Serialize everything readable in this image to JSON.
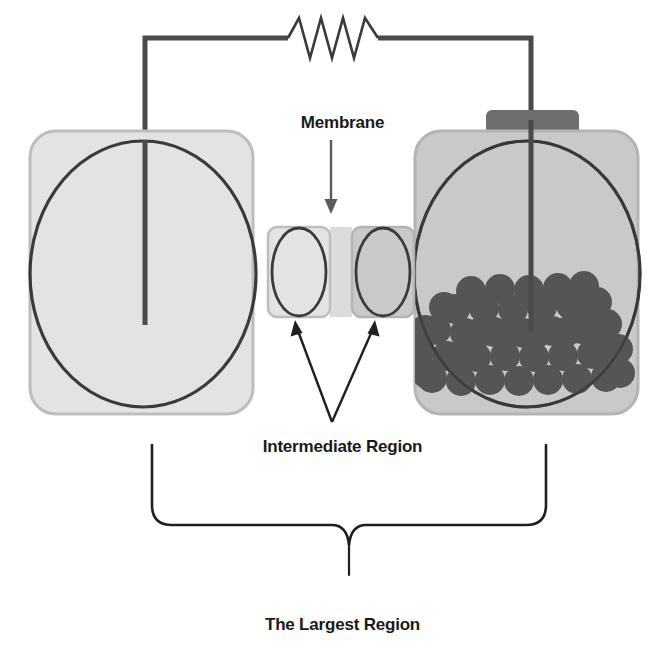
{
  "figure": {
    "kind": "electrochemical-cell-schematic",
    "background_color": "#ffffff"
  },
  "labels": {
    "membrane": "Membrane",
    "intermediate_region": "Intermediate Region",
    "largest_region": "The Largest Region"
  },
  "colors": {
    "chamber_fill_left": "#e3e3e3",
    "chamber_fill_right": "#c9c9c9",
    "chamber_stroke": "#b9b9b9",
    "membrane_fill": "#dcdcdc",
    "outline_dark": "#3a3a3a",
    "electrode": "#4a4a4a",
    "wire": "#4a4a4a",
    "cap_fill": "#6e6e6e",
    "particle_fill": "#555555",
    "text": "#1a1a1a"
  },
  "circuit": {
    "resistor_peaks": 4,
    "wire_top_y": 38,
    "left_electrode_x": 145,
    "right_electrode_x": 531,
    "resistor_start_x": 288,
    "resistor_end_x": 378
  },
  "chambers": {
    "left": {
      "name": "left-reservoir",
      "x": 30,
      "y": 131,
      "width": 223,
      "height": 283,
      "radius": 26,
      "ellipse_cx": 143,
      "ellipse_cy": 274,
      "ellipse_rx": 113,
      "ellipse_ry": 133
    },
    "right": {
      "name": "right-reservoir",
      "x": 415,
      "y": 131,
      "width": 223,
      "height": 283,
      "radius": 26,
      "ellipse_cx": 527,
      "ellipse_cy": 274,
      "ellipse_rx": 113,
      "ellipse_ry": 133,
      "cap": {
        "x": 486,
        "y": 110,
        "width": 93,
        "height": 25,
        "radius": 6
      }
    },
    "intermediate_left": {
      "name": "intermediate-chamber-left",
      "x": 268,
      "y": 227,
      "width": 62,
      "height": 90,
      "radius": 9,
      "ellipse_cx": 299,
      "ellipse_cy": 272,
      "ellipse_rx": 27,
      "ellipse_ry": 44
    },
    "intermediate_right": {
      "name": "intermediate-chamber-right",
      "x": 352,
      "y": 227,
      "width": 62,
      "height": 90,
      "radius": 9,
      "ellipse_cx": 383,
      "ellipse_cy": 272,
      "ellipse_rx": 27,
      "ellipse_ry": 44
    },
    "membrane_strip": {
      "x": 330,
      "y": 227,
      "width": 22,
      "height": 90
    }
  },
  "particles": {
    "count": 46,
    "radius": 15,
    "items": [
      [
        432,
        378
      ],
      [
        461,
        381
      ],
      [
        490,
        380
      ],
      [
        519,
        381
      ],
      [
        548,
        380
      ],
      [
        577,
        379
      ],
      [
        606,
        377
      ],
      [
        419,
        352
      ],
      [
        447,
        356
      ],
      [
        476,
        357
      ],
      [
        505,
        356
      ],
      [
        534,
        357
      ],
      [
        563,
        356
      ],
      [
        592,
        354
      ],
      [
        618,
        349
      ],
      [
        436,
        330
      ],
      [
        465,
        333
      ],
      [
        494,
        332
      ],
      [
        523,
        333
      ],
      [
        552,
        331
      ],
      [
        581,
        329
      ],
      [
        607,
        324
      ],
      [
        455,
        309
      ],
      [
        484,
        308
      ],
      [
        513,
        309
      ],
      [
        542,
        307
      ],
      [
        571,
        305
      ],
      [
        597,
        302
      ],
      [
        471,
        291
      ],
      [
        500,
        289
      ],
      [
        529,
        290
      ],
      [
        558,
        288
      ],
      [
        584,
        286
      ],
      [
        444,
        307
      ],
      [
        425,
        330
      ],
      [
        413,
        352
      ],
      [
        427,
        374
      ],
      [
        456,
        358
      ],
      [
        609,
        352
      ],
      [
        620,
        373
      ],
      [
        599,
        329
      ],
      [
        588,
        307
      ],
      [
        566,
        332
      ],
      [
        537,
        333
      ],
      [
        508,
        333
      ],
      [
        479,
        333
      ]
    ]
  },
  "annotations": {
    "membrane_arrow": {
      "x": 331,
      "y_start": 140,
      "y_end": 212
    },
    "intermediate_arrows": {
      "apex_x": 332,
      "apex_y": 422,
      "left_tip_x": 296,
      "left_tip_y": 322,
      "right_tip_x": 374,
      "right_tip_y": 322
    },
    "brace": {
      "left_x": 152,
      "right_x": 546,
      "top_y": 445,
      "bar_y": 525,
      "tip_y": 575,
      "center_x": 349
    }
  }
}
